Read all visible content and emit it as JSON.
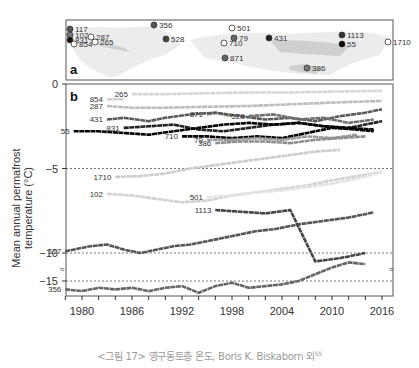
{
  "caption": {
    "text": "<그림 17> 영구동토층 온도, Boris K. Biskaborn 외",
    "superscript": "55"
  },
  "chart_data": {
    "type": "line",
    "title": "",
    "panels": [
      "a",
      "b"
    ],
    "xlabel": "",
    "ylabel": "Mean annual permafrost temperature (°C)",
    "x_ticks": [
      1980,
      1986,
      1992,
      1998,
      2004,
      2010,
      2016
    ],
    "y_ticks": [
      0,
      -5,
      -10,
      -15
    ],
    "xlim": [
      1977,
      2017
    ],
    "ylim": [
      -16.5,
      0
    ],
    "axis_break": "between -10 and -15",
    "reference_lines": [
      -5,
      -10,
      -15
    ],
    "map_sites": [
      {
        "id": "117",
        "x": 70,
        "y": 29,
        "fill": "#555"
      },
      {
        "id": "102",
        "x": 70,
        "y": 35,
        "fill": "#777"
      },
      {
        "id": "831",
        "x": 70,
        "y": 40,
        "fill": "#111"
      },
      {
        "id": "854",
        "x": 74,
        "y": 44,
        "fill": "#fff"
      },
      {
        "id": "287",
        "x": 91,
        "y": 37,
        "fill": "#fff"
      },
      {
        "id": "265",
        "x": 95,
        "y": 42,
        "fill": "#fff"
      },
      {
        "id": "356",
        "x": 154,
        "y": 25,
        "fill": "#555"
      },
      {
        "id": "528",
        "x": 166,
        "y": 39,
        "fill": "#444"
      },
      {
        "id": "501",
        "x": 232,
        "y": 28,
        "fill": "#fff"
      },
      {
        "id": "79",
        "x": 234,
        "y": 38,
        "fill": "#666"
      },
      {
        "id": "710",
        "x": 224,
        "y": 43,
        "fill": "#fff"
      },
      {
        "id": "871",
        "x": 225,
        "y": 58,
        "fill": "#666"
      },
      {
        "id": "431",
        "x": 269,
        "y": 38,
        "fill": "#222"
      },
      {
        "id": "386",
        "x": 307,
        "y": 68,
        "fill": "#777"
      },
      {
        "id": "1113",
        "x": 342,
        "y": 35,
        "fill": "#333"
      },
      {
        "id": "55",
        "x": 342,
        "y": 44,
        "fill": "#000"
      },
      {
        "id": "1710",
        "x": 388,
        "y": 42,
        "fill": "#fff"
      }
    ],
    "series": [
      {
        "name": "265",
        "color": "#d6d6d6",
        "x": [
          1986,
          1990,
          1995,
          2000,
          2005,
          2010,
          2016
        ],
        "values": [
          -0.6,
          -0.6,
          -0.55,
          -0.5,
          -0.5,
          -0.45,
          -0.4
        ]
      },
      {
        "name": "854",
        "color": "#cfcfcf",
        "x": [
          1983,
          1984,
          1985
        ],
        "values": [
          -0.9,
          -0.9,
          -0.9
        ]
      },
      {
        "name": "287",
        "color": "#bdbdbd",
        "x": [
          1983,
          1986,
          1990,
          1995,
          2000,
          2005,
          2010,
          2016
        ],
        "values": [
          -1.3,
          -1.4,
          -1.4,
          -1.35,
          -1.3,
          -1.2,
          -1.1,
          -1.0
        ]
      },
      {
        "name": "871",
        "color": "#8a8a8a",
        "x": [
          1995,
          1996,
          1998
        ],
        "values": [
          -1.8,
          -1.7,
          -1.9
        ]
      },
      {
        "name": "431",
        "color": "#5a5a5a",
        "x": [
          1983,
          1985,
          1988,
          1990,
          1993,
          1996,
          1999,
          2002,
          2005,
          2008,
          2011,
          2014,
          2016
        ],
        "values": [
          -2.1,
          -2.0,
          -2.2,
          -2.0,
          -1.8,
          -1.7,
          -1.9,
          -2.1,
          -2.0,
          -2.2,
          -1.9,
          -1.7,
          -1.5
        ]
      },
      {
        "name": "528",
        "color": "#6f6f6f",
        "x": [
          2000,
          2003,
          2006,
          2009,
          2012,
          2015
        ],
        "values": [
          -1.9,
          -1.8,
          -2.1,
          -2.0,
          -2.3,
          -2.1
        ]
      },
      {
        "name": "831",
        "color": "#222222",
        "x": [
          1985,
          1988,
          1991,
          1994,
          1997,
          2000,
          2003,
          2006,
          2009,
          2012,
          2016
        ],
        "values": [
          -2.6,
          -2.5,
          -2.4,
          -2.7,
          -2.8,
          -2.6,
          -2.4,
          -2.3,
          -2.5,
          -2.6,
          -2.2
        ]
      },
      {
        "name": "55",
        "color": "#000000",
        "x": [
          1979,
          1982,
          1985,
          1988,
          1991,
          1994,
          1997,
          2000,
          2003,
          2006,
          2009,
          2012,
          2015
        ],
        "values": [
          -2.8,
          -2.8,
          -2.9,
          -3.0,
          -2.8,
          -2.6,
          -2.4,
          -2.3,
          -2.4,
          -2.3,
          -2.5,
          -2.6,
          -2.7
        ]
      },
      {
        "name": "710",
        "color": "#000000",
        "x": [
          1992,
          1995,
          1998,
          2001,
          2004,
          2007,
          2010,
          2013,
          2015
        ],
        "values": [
          -3.1,
          -3.1,
          -3.2,
          -3.1,
          -3.2,
          -2.9,
          -2.6,
          -2.7,
          -2.8
        ]
      },
      {
        "name": "79",
        "color": "#9a9a9a",
        "x": [
          1995,
          1998,
          2001,
          2004,
          2007,
          2010,
          2013
        ],
        "values": [
          -3.3,
          -3.3,
          -3.2,
          -3.3,
          -3.1,
          -3.2,
          -3.0
        ]
      },
      {
        "name": "386",
        "color": "#8d8d8d",
        "x": [
          1996,
          1999,
          2002,
          2005,
          2008,
          2011,
          2014
        ],
        "values": [
          -3.5,
          -3.4,
          -3.4,
          -3.5,
          -3.3,
          -3.2,
          -3.1
        ]
      },
      {
        "name": "1710",
        "color": "#cccccc",
        "x": [
          1984,
          1987,
          1990,
          1993,
          1996,
          1999,
          2002,
          2005,
          2008,
          2011
        ],
        "values": [
          -5.5,
          -5.45,
          -5.3,
          -5.0,
          -4.8,
          -4.6,
          -4.4,
          -4.2,
          -4.0,
          -3.9
        ]
      },
      {
        "name": "102",
        "color": "#d2d2d2",
        "x": [
          1983,
          1986,
          1989,
          1992,
          1995,
          1998,
          2001,
          2004,
          2007,
          2010,
          2016
        ],
        "values": [
          -6.5,
          -6.6,
          -6.8,
          -7.0,
          -6.9,
          -6.6,
          -6.4,
          -6.2,
          -6.0,
          -5.7,
          -5.2
        ]
      },
      {
        "name": "501",
        "color": "#e3e3e3",
        "x": [
          1995,
          1998,
          2001,
          2004,
          2007,
          2010,
          2013,
          2016
        ],
        "values": [
          -6.7,
          -6.6,
          -6.4,
          -6.3,
          -6.1,
          -5.9,
          -5.6,
          -5.2
        ]
      },
      {
        "name": "117",
        "color": "#555555",
        "x": [
          1978,
          1981,
          1983,
          1985,
          1987,
          1989,
          1991,
          1993,
          1995,
          1997,
          1999,
          2001,
          2003,
          2006,
          2009,
          2012,
          2015
        ],
        "values": [
          -9.9,
          -9.6,
          -9.5,
          -9.8,
          -10.0,
          -9.8,
          -9.6,
          -9.5,
          -9.3,
          -9.1,
          -8.9,
          -8.7,
          -8.6,
          -8.3,
          -8.1,
          -7.9,
          -7.6
        ]
      },
      {
        "name": "1113",
        "color": "#444444",
        "x": [
          1996,
          1999,
          2002,
          2005,
          2008,
          2011,
          2014
        ],
        "values": [
          -10.8,
          -10.9,
          -11.0,
          -10.8,
          -10.5,
          -10.3,
          -10.0
        ]
      },
      {
        "name": "356",
        "color": "#666666",
        "x": [
          1978,
          1980,
          1982,
          1984,
          1986,
          1988,
          1990,
          1992,
          1994,
          1996,
          1998,
          2000,
          2002,
          2004,
          2006,
          2008,
          2010,
          2012,
          2014
        ],
        "values": [
          -15.5,
          -15.6,
          -15.4,
          -15.5,
          -15.4,
          -15.6,
          -15.4,
          -15.3,
          -15.7,
          -15.3,
          -15.1,
          -15.4,
          -15.3,
          -15.2,
          -15.0,
          -14.6,
          -14.2,
          -13.9,
          -14.0
        ]
      }
    ]
  }
}
